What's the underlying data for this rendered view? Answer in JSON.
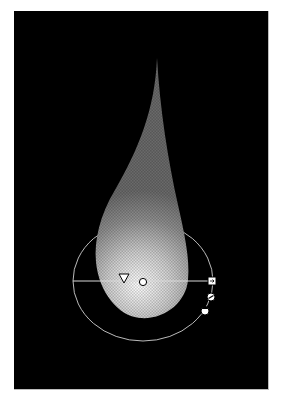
{
  "canvas": {
    "background": "#000000",
    "page_background": "#ffffff"
  },
  "artwork": {
    "shape": "teardrop",
    "fill": "radial-gradient",
    "gradient": {
      "type": "radial",
      "stops": [
        {
          "offset": 0,
          "color": "#ffffff"
        },
        {
          "offset": 0.45,
          "color": "#bdbdbd"
        },
        {
          "offset": 1,
          "color": "#6e6e6e"
        }
      ],
      "transparency_pattern": "checker"
    }
  },
  "gradient_annotator": {
    "origin_marker": "triangle-origin-handle",
    "center_marker": "circle-center-handle",
    "end_marker": "square-end-handle",
    "rotate_handle": "rotate-handle",
    "aspect_handle": "aspect-ratio-handle",
    "ellipse": "gradient-ellipse-outline",
    "line_color": "#d9d9d9"
  }
}
